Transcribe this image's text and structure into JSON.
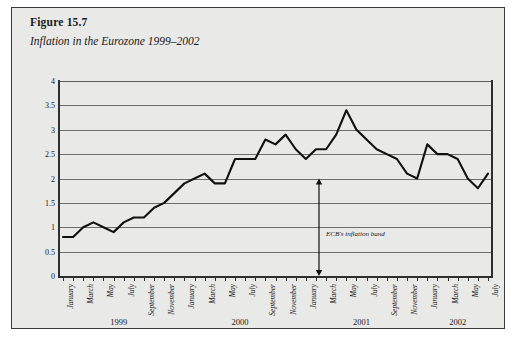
{
  "figure": {
    "number": "Figure 15.7",
    "title": "Inflation in the Eurozone 1999–2002"
  },
  "annotation": {
    "band_label": "ECB's inflation band",
    "band_low": 0,
    "band_high": 2
  },
  "colors": {
    "background": "#e9e9e7",
    "border": "#3a3a3a",
    "line": "#111111",
    "grid": "#6d6d6d",
    "axis": "#2e2e2e"
  },
  "chart_data": {
    "type": "line",
    "title": "Inflation in the Eurozone 1999–2002",
    "xlabel": "",
    "ylabel": "",
    "ylim": [
      0,
      4
    ],
    "ytick_labels": [
      "0",
      "0.5",
      "1",
      "1.5",
      "2",
      "2.5",
      "3",
      "3.5",
      "4"
    ],
    "ytick_values": [
      0,
      0.5,
      1,
      1.5,
      2,
      2.5,
      3,
      3.5,
      4
    ],
    "grid": true,
    "legend": "none",
    "x": [
      "January 1999",
      "February 1999",
      "March 1999",
      "April 1999",
      "May 1999",
      "June 1999",
      "July 1999",
      "August 1999",
      "September 1999",
      "October 1999",
      "November 1999",
      "December 1999",
      "January 2000",
      "February 2000",
      "March 2000",
      "April 2000",
      "May 2000",
      "June 2000",
      "July 2000",
      "August 2000",
      "September 2000",
      "October 2000",
      "November 2000",
      "December 2000",
      "January 2001",
      "February 2001",
      "March 2001",
      "April 2001",
      "May 2001",
      "June 2001",
      "July 2001",
      "August 2001",
      "September 2001",
      "October 2001",
      "November 2001",
      "December 2001",
      "January 2002",
      "February 2002",
      "March 2002",
      "April 2002",
      "May 2002",
      "June 2002",
      "July 2002"
    ],
    "xtick_labels": [
      "January",
      "",
      "March",
      "",
      "May",
      "",
      "July",
      "",
      "September",
      "",
      "November",
      "",
      "January",
      "",
      "March",
      "",
      "May",
      "",
      "July",
      "",
      "September",
      "",
      "November",
      "",
      "January",
      "",
      "March",
      "",
      "May",
      "",
      "July",
      "",
      "September",
      "",
      "November",
      "",
      "January",
      "",
      "March",
      "",
      "May",
      "",
      "July"
    ],
    "year_groups": [
      {
        "label": "1999",
        "start_index": 0,
        "end_index": 11
      },
      {
        "label": "2000",
        "start_index": 12,
        "end_index": 23
      },
      {
        "label": "2001",
        "start_index": 24,
        "end_index": 35
      },
      {
        "label": "2002",
        "start_index": 36,
        "end_index": 42
      }
    ],
    "values": [
      0.8,
      0.8,
      1.0,
      1.1,
      1.0,
      0.9,
      1.1,
      1.2,
      1.2,
      1.4,
      1.5,
      1.7,
      1.9,
      2.0,
      2.1,
      1.9,
      1.9,
      2.4,
      2.4,
      2.4,
      2.8,
      2.7,
      2.9,
      2.6,
      2.4,
      2.6,
      2.6,
      2.9,
      3.4,
      3.0,
      2.8,
      2.6,
      2.5,
      2.4,
      2.1,
      2.0,
      2.7,
      2.5,
      2.5,
      2.4,
      2.0,
      1.8,
      2.1
    ],
    "series": [
      {
        "name": "Eurozone HICP inflation (%)",
        "values": [
          0.8,
          0.8,
          1.0,
          1.1,
          1.0,
          0.9,
          1.1,
          1.2,
          1.2,
          1.4,
          1.5,
          1.7,
          1.9,
          2.0,
          2.1,
          1.9,
          1.9,
          2.4,
          2.4,
          2.4,
          2.8,
          2.7,
          2.9,
          2.6,
          2.4,
          2.6,
          2.6,
          2.9,
          3.4,
          3.0,
          2.8,
          2.6,
          2.5,
          2.4,
          2.1,
          2.0,
          2.7,
          2.5,
          2.5,
          2.4,
          2.0,
          1.8,
          2.1
        ]
      }
    ]
  }
}
